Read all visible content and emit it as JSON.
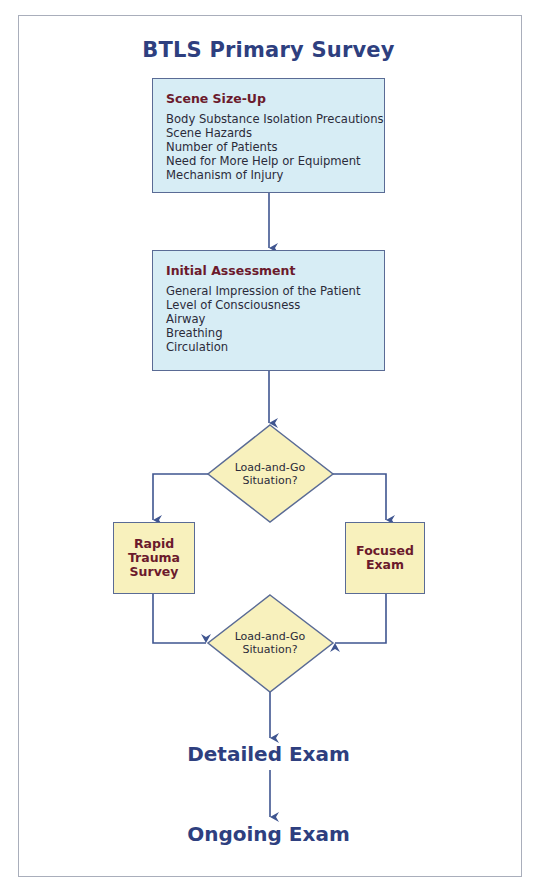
{
  "title": "BTLS Primary Survey",
  "scene_size_up": {
    "heading": "Scene Size-Up",
    "items": [
      "Body Substance Isolation Precautions",
      "Scene Hazards",
      "Number of Patients",
      "Need for More Help or Equipment",
      "Mechanism of Injury"
    ]
  },
  "initial_assessment": {
    "heading": "Initial Assessment",
    "items": [
      "General Impression of the Patient",
      "Level of Consciousness",
      "Airway",
      "Breathing",
      "Circulation"
    ]
  },
  "decision_1": {
    "line1": "Load-and-Go",
    "line2": "Situation?"
  },
  "rapid_trauma": {
    "line1": "Rapid",
    "line2": "Trauma",
    "line3": "Survey"
  },
  "focused_exam": {
    "line1": "Focused",
    "line2": "Exam"
  },
  "decision_2": {
    "line1": "Load-and-Go",
    "line2": "Situation?"
  },
  "detailed_exam": "Detailed Exam",
  "ongoing_exam": "Ongoing Exam",
  "colors": {
    "title_blue": "#2e3f7f",
    "heading_maroon": "#6b1a2c",
    "blue_box_fill": "#d7edf5",
    "yellow_fill": "#f8f1bd",
    "connector": "#3f5590"
  }
}
